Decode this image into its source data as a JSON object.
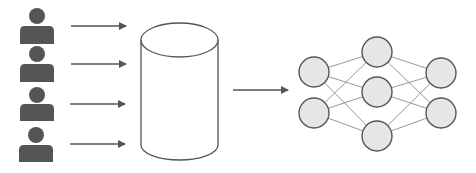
{
  "diagram": {
    "colors": {
      "person": "#555555",
      "arrow": "#555555",
      "cylinder_stroke": "#555555",
      "node_fill": "#e6e6e6",
      "node_stroke": "#555555",
      "edge": "#999999",
      "background": "#ffffff"
    },
    "users": [
      {
        "id": "user-1",
        "icon": "person-icon"
      },
      {
        "id": "user-2",
        "icon": "person-icon"
      },
      {
        "id": "user-3",
        "icon": "person-icon"
      },
      {
        "id": "user-4",
        "icon": "person-icon"
      }
    ],
    "database": {
      "icon": "database-cylinder-icon"
    },
    "neural_network": {
      "layers": [
        2,
        3,
        2
      ]
    }
  }
}
